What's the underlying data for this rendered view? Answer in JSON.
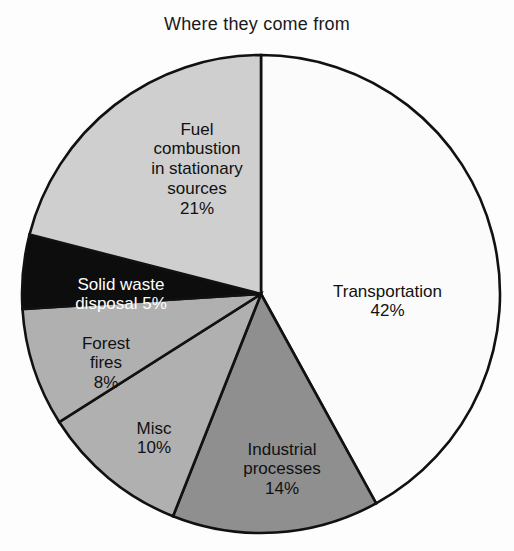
{
  "chart_data": {
    "type": "pie",
    "title": "Where they come from",
    "xlabel": "",
    "ylabel": "",
    "legend_position": "none",
    "grid": false,
    "units": "percent",
    "start_angle_deg": 0,
    "direction": "clockwise",
    "categories": [
      "Transportation",
      "Industrial processes",
      "Misc",
      "Forest fires",
      "Solid waste disposal",
      "Fuel combustion in stationary sources"
    ],
    "values": [
      42,
      14,
      10,
      8,
      5,
      21
    ],
    "slice_colors": [
      "#fbfbfb",
      "#8f8f8f",
      "#b0b0b0",
      "#b0b0b0",
      "#0d0d0d",
      "#cfcfcf"
    ],
    "slices": [
      {
        "name": "Transportation",
        "label": "Transportation",
        "value": 42,
        "percent_text": "42%",
        "color": "#fbfbfb",
        "text_color": "#111111",
        "start_deg": 0,
        "end_deg": 151.2
      },
      {
        "name": "Industrial processes",
        "label": "Industrial\nprocesses",
        "value": 14,
        "percent_text": "14%",
        "color": "#8f8f8f",
        "text_color": "#111111",
        "start_deg": 151.2,
        "end_deg": 201.6
      },
      {
        "name": "Misc",
        "label": "Misc",
        "value": 10,
        "percent_text": "10%",
        "color": "#b0b0b0",
        "text_color": "#111111",
        "start_deg": 201.6,
        "end_deg": 237.6
      },
      {
        "name": "Forest fires",
        "label": "Forest\nfires",
        "value": 8,
        "percent_text": "8%",
        "color": "#b0b0b0",
        "text_color": "#111111",
        "start_deg": 237.6,
        "end_deg": 266.4
      },
      {
        "name": "Solid waste disposal",
        "label": "Solid waste\ndisposal 5%",
        "value": 5,
        "percent_text": "",
        "color": "#0d0d0d",
        "text_color": "#ffffff",
        "start_deg": 266.4,
        "end_deg": 284.4
      },
      {
        "name": "Fuel combustion in stationary sources",
        "label": "Fuel\ncombustion\nin stationary\nsources",
        "value": 21,
        "percent_text": "21%",
        "color": "#cfcfcf",
        "text_color": "#111111",
        "start_deg": 284.4,
        "end_deg": 360
      }
    ],
    "geometry": {
      "center_x": 261,
      "center_y": 294,
      "radius": 239
    },
    "outline_color": "#111111",
    "background_color": "#fdfdfd"
  }
}
